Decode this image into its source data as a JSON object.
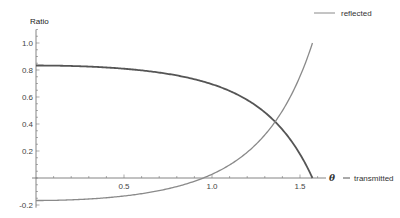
{
  "chart_data": {
    "type": "line",
    "title": "",
    "xlabel": "θ",
    "ylabel": "Ratio",
    "xlim": [
      0,
      1.62
    ],
    "ylim": [
      -0.22,
      1.1
    ],
    "grid": false,
    "x_ticks": [
      0.5,
      1.0,
      1.5
    ],
    "x_tick_labels": [
      "0.5",
      "1.0",
      "1.5"
    ],
    "y_ticks": [
      -0.2,
      0.2,
      0.4,
      0.6,
      0.8,
      1.0
    ],
    "y_tick_labels": [
      "-0.2",
      "0.2",
      "0.4",
      "0.6",
      "0.8",
      "1.0"
    ],
    "legend_position": "curve-end labels (right)",
    "x": [
      0,
      0.5,
      1.0,
      1.2,
      1.4,
      1.5,
      1.5708
    ],
    "series": [
      {
        "name": "reflected",
        "color": "#8a8a8a",
        "values": [
          -0.167,
          -0.133,
          0.028,
          0.191,
          0.498,
          0.753,
          1.0
        ]
      },
      {
        "name": "transmitted",
        "color": "#555555",
        "values": [
          0.833,
          0.81,
          0.695,
          0.578,
          0.359,
          0.177,
          0.0
        ]
      }
    ],
    "model": {
      "relative_index": 1.4,
      "polarization": "p"
    }
  },
  "labels": {
    "ylabel": "Ratio",
    "xlabel": "θ",
    "reflected": "reflected",
    "transmitted": "transmitted"
  }
}
